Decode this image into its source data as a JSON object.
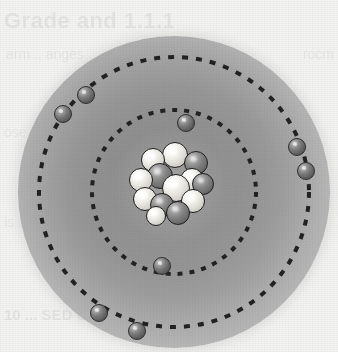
{
  "figure": {
    "title": "Bohr model of the atom",
    "alt_text": "Shaded sphere representing the electron cloud of an atom, with two dashed circular orbits around a central cluster of protons and neutrons",
    "background_color": "#f3f3f1",
    "cloud_color_center": "#9d9d9d",
    "cloud_color_edge": "#dcdcdc",
    "orbit_color": "#222222",
    "electron_color": "#5a5a5a",
    "proton_color": "#f2f0ea",
    "neutron_color": "#7c7c7c",
    "cloud": {
      "cx": 174,
      "cy": 192,
      "r": 156
    }
  },
  "orbits": [
    {
      "name": "inner-shell",
      "label": "K shell",
      "radius": 82,
      "dash": "5 7",
      "stroke_width": 4,
      "electron_count": 2
    },
    {
      "name": "outer-shell",
      "label": "L shell",
      "radius": 135,
      "dash": "6 8",
      "stroke_width": 4,
      "electron_count": 6
    }
  ],
  "electrons": [
    {
      "shell": "inner-shell",
      "label": "electron",
      "x": 186,
      "y": 123,
      "r": 9
    },
    {
      "shell": "inner-shell",
      "label": "electron",
      "x": 162,
      "y": 266,
      "r": 9
    },
    {
      "shell": "outer-shell",
      "label": "electron",
      "x": 86,
      "y": 95,
      "r": 9
    },
    {
      "shell": "outer-shell",
      "label": "electron",
      "x": 63,
      "y": 114,
      "r": 9
    },
    {
      "shell": "outer-shell",
      "label": "electron",
      "x": 297,
      "y": 147,
      "r": 9
    },
    {
      "shell": "outer-shell",
      "label": "electron",
      "x": 306,
      "y": 171,
      "r": 9
    },
    {
      "shell": "outer-shell",
      "label": "electron",
      "x": 99,
      "y": 313,
      "r": 9
    },
    {
      "shell": "outer-shell",
      "label": "electron",
      "x": 137,
      "y": 331,
      "r": 9
    }
  ],
  "nucleus": {
    "label": "nucleus",
    "cx": 170,
    "cy": 185,
    "particles": [
      {
        "type": "proton",
        "x": 153,
        "y": 160,
        "r": 12
      },
      {
        "type": "proton",
        "x": 175,
        "y": 155,
        "r": 13
      },
      {
        "type": "neutron",
        "x": 196,
        "y": 163,
        "r": 12
      },
      {
        "type": "neutron",
        "x": 160,
        "y": 176,
        "r": 13
      },
      {
        "type": "proton",
        "x": 141,
        "y": 180,
        "r": 12
      },
      {
        "type": "proton",
        "x": 192,
        "y": 180,
        "r": 12
      },
      {
        "type": "neutron",
        "x": 203,
        "y": 184,
        "r": 11
      },
      {
        "type": "proton",
        "x": 176,
        "y": 188,
        "r": 14
      },
      {
        "type": "proton",
        "x": 145,
        "y": 199,
        "r": 12
      },
      {
        "type": "neutron",
        "x": 162,
        "y": 205,
        "r": 12
      },
      {
        "type": "proton",
        "x": 193,
        "y": 201,
        "r": 12
      },
      {
        "type": "neutron",
        "x": 178,
        "y": 213,
        "r": 12
      },
      {
        "type": "proton",
        "x": 156,
        "y": 216,
        "r": 10
      }
    ]
  },
  "page_bleed_text": {
    "title": "Grade and 1.1.1",
    "line1": "arm .. anges",
    "line2": "ose",
    "line3": "is an",
    "line4": "10 ... SED CH",
    "right1": "rocm"
  }
}
